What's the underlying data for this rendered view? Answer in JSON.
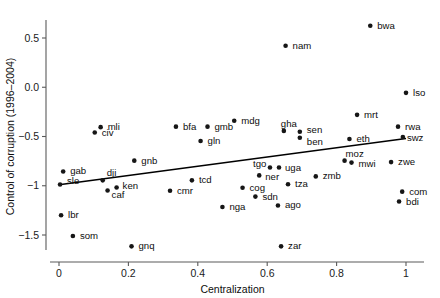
{
  "chart_data": {
    "type": "scatter",
    "title": "",
    "xlabel": "Centralization",
    "ylabel": "Control of corruption (1996–2004)",
    "xlim": [
      -0.02,
      1.04
    ],
    "ylim": [
      -1.72,
      0.78
    ],
    "grid": false,
    "legend": null,
    "xticks": [
      0,
      0.2,
      0.4,
      0.6,
      0.8,
      1
    ],
    "xticklabels": [
      "0",
      "0.2",
      "0.4",
      "0.6",
      "0.8",
      "1"
    ],
    "yticks": [
      0.5,
      0.0,
      -0.5,
      -1,
      -1.5
    ],
    "yticklabels": [
      "0.5",
      "0.0",
      "−0.5",
      "−1",
      "−1.5"
    ],
    "trend_line": {
      "x": [
        0.0,
        1.0
      ],
      "y": [
        -0.99,
        -0.52
      ]
    },
    "points": [
      {
        "label": "bwa",
        "x": 0.897,
        "y": 0.625,
        "lx": 7,
        "ly": 3
      },
      {
        "label": "nam",
        "x": 0.653,
        "y": 0.422,
        "lx": 7,
        "ly": 3
      },
      {
        "label": "lso",
        "x": 1.0,
        "y": -0.057,
        "lx": 7,
        "ly": 3
      },
      {
        "label": "mrt",
        "x": 0.859,
        "y": -0.28,
        "lx": 7,
        "ly": 3
      },
      {
        "label": "mli",
        "x": 0.12,
        "y": -0.405,
        "lx": 7,
        "ly": 3
      },
      {
        "label": "bfa",
        "x": 0.337,
        "y": -0.4,
        "lx": 7,
        "ly": 3
      },
      {
        "label": "gmb",
        "x": 0.428,
        "y": -0.4,
        "lx": 7,
        "ly": 3
      },
      {
        "label": "mdg",
        "x": 0.505,
        "y": -0.34,
        "lx": 7,
        "ly": 3
      },
      {
        "label": "gha",
        "x": 0.648,
        "y": -0.443,
        "lx": -3,
        "ly": -4
      },
      {
        "label": "rwa",
        "x": 0.977,
        "y": -0.4,
        "lx": 7,
        "ly": 3
      },
      {
        "label": "civ",
        "x": 0.103,
        "y": -0.46,
        "lx": 7,
        "ly": 3
      },
      {
        "label": "gln",
        "x": 0.408,
        "y": -0.545,
        "lx": 7,
        "ly": 3
      },
      {
        "label": "sen",
        "x": 0.694,
        "y": -0.452,
        "lx": 7,
        "ly": 1
      },
      {
        "label": "ben",
        "x": 0.694,
        "y": -0.512,
        "lx": 7,
        "ly": 7
      },
      {
        "label": "eth",
        "x": 0.837,
        "y": -0.525,
        "lx": 7,
        "ly": 3
      },
      {
        "label": "swz",
        "x": 0.991,
        "y": -0.505,
        "lx": 4,
        "ly": 4
      },
      {
        "label": "gnb",
        "x": 0.217,
        "y": -0.745,
        "lx": 7,
        "ly": 3
      },
      {
        "label": "moz",
        "x": 0.823,
        "y": -0.745,
        "lx": 1,
        "ly": -4
      },
      {
        "label": "mwi",
        "x": 0.843,
        "y": -0.765,
        "lx": 7,
        "ly": 4
      },
      {
        "label": "zwe",
        "x": 0.957,
        "y": -0.76,
        "lx": 7,
        "ly": 3
      },
      {
        "label": "gab",
        "x": 0.012,
        "y": -0.855,
        "lx": 7,
        "ly": 3
      },
      {
        "label": "dji",
        "x": 0.126,
        "y": -0.945,
        "lx": 4,
        "ly": -4
      },
      {
        "label": "tgo",
        "x": 0.608,
        "y": -0.815,
        "lx": -17,
        "ly": -1
      },
      {
        "label": "uga",
        "x": 0.634,
        "y": -0.815,
        "lx": 6,
        "ly": 3
      },
      {
        "label": "ner",
        "x": 0.577,
        "y": -0.895,
        "lx": 6,
        "ly": 5
      },
      {
        "label": "zmb",
        "x": 0.74,
        "y": -0.905,
        "lx": 7,
        "ly": 3
      },
      {
        "label": "sle",
        "x": 0.003,
        "y": -0.988,
        "lx": 7,
        "ly": -1
      },
      {
        "label": "ken",
        "x": 0.166,
        "y": -1.018,
        "lx": 6,
        "ly": 1
      },
      {
        "label": "caf",
        "x": 0.14,
        "y": -1.048,
        "lx": 4,
        "ly": 8
      },
      {
        "label": "tcd",
        "x": 0.383,
        "y": -0.945,
        "lx": 7,
        "ly": 3
      },
      {
        "label": "tza",
        "x": 0.66,
        "y": -0.985,
        "lx": 7,
        "ly": 3
      },
      {
        "label": "com",
        "x": 0.989,
        "y": -1.06,
        "lx": 7,
        "ly": 3
      },
      {
        "label": "cog",
        "x": 0.529,
        "y": -1.02,
        "lx": 7,
        "ly": 3
      },
      {
        "label": "cmr",
        "x": 0.32,
        "y": -1.05,
        "lx": 7,
        "ly": 3
      },
      {
        "label": "sdn",
        "x": 0.566,
        "y": -1.11,
        "lx": 7,
        "ly": 3
      },
      {
        "label": "bdi",
        "x": 0.98,
        "y": -1.16,
        "lx": 7,
        "ly": 3
      },
      {
        "label": "nga",
        "x": 0.471,
        "y": -1.215,
        "lx": 7,
        "ly": 3
      },
      {
        "label": "ago",
        "x": 0.631,
        "y": -1.2,
        "lx": 7,
        "ly": 3
      },
      {
        "label": "lbr",
        "x": 0.006,
        "y": -1.3,
        "lx": 7,
        "ly": 3
      },
      {
        "label": "som",
        "x": 0.04,
        "y": -1.51,
        "lx": 7,
        "ly": 3
      },
      {
        "label": "gnq",
        "x": 0.209,
        "y": -1.615,
        "lx": 7,
        "ly": 3
      },
      {
        "label": "zar",
        "x": 0.64,
        "y": -1.615,
        "lx": 7,
        "ly": 3
      }
    ]
  }
}
